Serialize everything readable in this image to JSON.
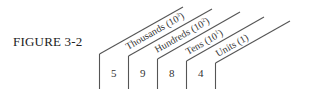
{
  "figure": {
    "label": "FIGURE 3-2"
  },
  "place_value": {
    "columns": [
      {
        "name": "Thousands",
        "power": "3",
        "digit": "5"
      },
      {
        "name": "Hundreds",
        "power": "2",
        "digit": "9"
      },
      {
        "name": "Tens",
        "power": "1",
        "digit": "8"
      },
      {
        "name": "Units",
        "power": "",
        "unit_text": "1",
        "digit": "4"
      }
    ]
  },
  "labels": {
    "thousands_name": "Thousands (10",
    "thousands_power": "3",
    "hundreds_name": "Hundreds (10",
    "hundreds_power": "2",
    "tens_name": "Tens (10",
    "tens_power": "1",
    "units_text": "Units (1)",
    "close_paren": ")"
  },
  "digits": {
    "thousands": "5",
    "hundreds": "9",
    "tens": "8",
    "units": "4"
  }
}
